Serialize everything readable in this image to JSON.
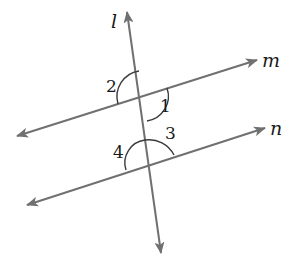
{
  "diagram": {
    "title": "",
    "colors": {
      "line": "#707070",
      "arc": "#3a3a3a",
      "text": "#1a1a1a",
      "background": "#ffffff"
    },
    "lines": [
      {
        "name": "l",
        "label": "l",
        "role": "transversal",
        "from": [
          161,
          253
        ],
        "to": [
          127,
          12
        ],
        "arrows": "both"
      },
      {
        "name": "m",
        "label": "m",
        "role": "parallel",
        "from": [
          17,
          136
        ],
        "to": [
          257,
          60
        ],
        "arrows": "both"
      },
      {
        "name": "n",
        "label": "n",
        "role": "parallel",
        "from": [
          27,
          205
        ],
        "to": [
          265,
          128
        ],
        "arrows": "both"
      }
    ],
    "angles": [
      {
        "label": "1",
        "at_intersection": "l-m",
        "position": "lower-right"
      },
      {
        "label": "2",
        "at_intersection": "l-m",
        "position": "upper-left"
      },
      {
        "label": "3",
        "at_intersection": "l-n",
        "position": "upper-right"
      },
      {
        "label": "4",
        "at_intersection": "l-n",
        "position": "upper-left"
      }
    ],
    "labels": {
      "line_l": "l",
      "line_m": "m",
      "line_n": "n",
      "angle_1": "1",
      "angle_2": "2",
      "angle_3": "3",
      "angle_4": "4"
    }
  }
}
